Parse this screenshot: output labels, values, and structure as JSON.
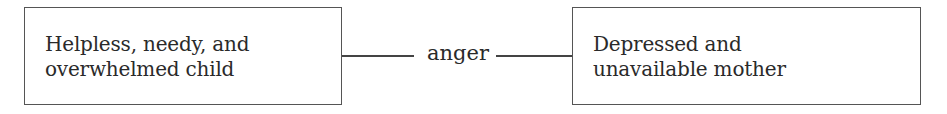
{
  "diagram": {
    "left_node": {
      "lines": [
        "Helpless, needy, and",
        "overwhelmed child"
      ]
    },
    "edge": {
      "label": "anger"
    },
    "right_node": {
      "lines": [
        "Depressed and",
        "unavailable mother"
      ]
    }
  }
}
